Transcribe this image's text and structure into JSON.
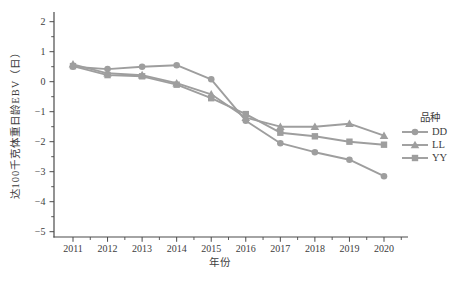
{
  "figure": {
    "background": "#ffffff",
    "series_color": "#9e9e9e",
    "axis_color": "#4a4a4a",
    "text_color": "#3d3d3d"
  },
  "chart_data": {
    "type": "line",
    "title": "",
    "xlabel": "年份",
    "ylabel": "达100千克体重日龄EBV（日）",
    "x": [
      2011,
      2012,
      2013,
      2014,
      2015,
      2016,
      2017,
      2018,
      2019,
      2020
    ],
    "xtick_labels": [
      "2011",
      "2012",
      "2013",
      "2014",
      "2015",
      "2016",
      "2017",
      "2018",
      "2019",
      "2020"
    ],
    "yticks": [
      2,
      1,
      0,
      -1,
      -2,
      -3,
      -4,
      -5
    ],
    "ytick_labels": [
      "2",
      "1",
      "0",
      "−1",
      "−2",
      "−3",
      "−4",
      "−5"
    ],
    "ylim": [
      -5,
      2
    ],
    "xlim": [
      2011,
      2020
    ],
    "grid": false,
    "legend_title": "品种",
    "legend_position": "right",
    "series": [
      {
        "name": "DD",
        "marker": "circle",
        "values": [
          0.5,
          0.42,
          0.5,
          0.55,
          0.08,
          -1.3,
          -2.05,
          -2.35,
          -2.6,
          -3.15
        ]
      },
      {
        "name": "LL",
        "marker": "triangle",
        "values": [
          0.58,
          0.28,
          0.22,
          -0.05,
          -0.42,
          -1.2,
          -1.5,
          -1.5,
          -1.4,
          -1.8
        ]
      },
      {
        "name": "YY",
        "marker": "square",
        "values": [
          0.52,
          0.22,
          0.18,
          -0.1,
          -0.55,
          -1.08,
          -1.7,
          -1.82,
          -2.0,
          -2.1
        ]
      }
    ]
  }
}
